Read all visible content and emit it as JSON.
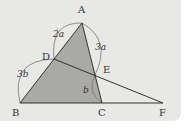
{
  "diagram": {
    "points": {
      "A": {
        "label": "A",
        "x": 82,
        "y": 23
      },
      "B": {
        "label": "B",
        "x": 20,
        "y": 103
      },
      "C": {
        "label": "C",
        "x": 102,
        "y": 103
      },
      "D": {
        "label": "D",
        "x": 54,
        "y": 59
      },
      "E": {
        "label": "E",
        "x": 95,
        "y": 75
      },
      "F": {
        "label": "F",
        "x": 163,
        "y": 103
      }
    },
    "lengths": {
      "AD": "2a",
      "AE": "3a",
      "DB": "3b",
      "EC": "b"
    },
    "colors": {
      "background": "#e8e8e6",
      "fill": "#a9a9a7",
      "line": "#333333",
      "arc": "#777777"
    }
  }
}
